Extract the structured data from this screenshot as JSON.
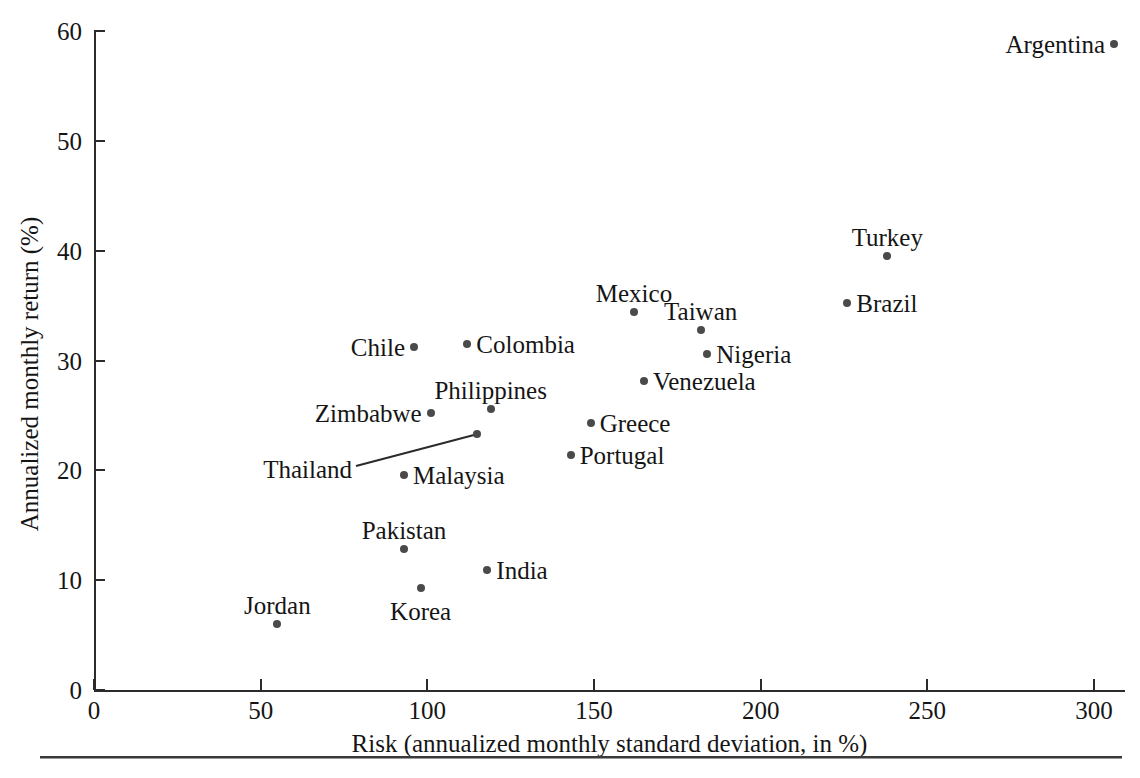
{
  "chart_data": {
    "type": "scatter",
    "title": "",
    "xlabel": "Risk (annualized monthly standard deviation, in %)",
    "ylabel": "Annualized monthly return (%)",
    "xlim": [
      0,
      310
    ],
    "ylim": [
      0,
      60
    ],
    "xticks": [
      0,
      50,
      100,
      150,
      200,
      250,
      300
    ],
    "yticks": [
      0,
      10,
      20,
      30,
      40,
      50,
      60
    ],
    "grid": false,
    "legend": "none",
    "point_color": "#4a4a4a",
    "axis_color": "#2b2b2b",
    "points": [
      {
        "name": "Argentina",
        "x": 306.0,
        "y": 58.8,
        "label_side": "left"
      },
      {
        "name": "Turkey",
        "x": 238.0,
        "y": 39.5,
        "label_side": "above"
      },
      {
        "name": "Brazil",
        "x": 226.0,
        "y": 35.2,
        "label_side": "right"
      },
      {
        "name": "Mexico",
        "x": 162.0,
        "y": 34.4,
        "label_side": "above"
      },
      {
        "name": "Taiwan",
        "x": 182.0,
        "y": 32.8,
        "label_side": "above"
      },
      {
        "name": "Colombia",
        "x": 112.0,
        "y": 31.5,
        "label_side": "right"
      },
      {
        "name": "Chile",
        "x": 96.0,
        "y": 31.2,
        "label_side": "left"
      },
      {
        "name": "Nigeria",
        "x": 184.0,
        "y": 30.6,
        "label_side": "right"
      },
      {
        "name": "Venezuela",
        "x": 165.0,
        "y": 28.1,
        "label_side": "right"
      },
      {
        "name": "Philippines",
        "x": 119.0,
        "y": 25.6,
        "label_side": "above"
      },
      {
        "name": "Zimbabwe",
        "x": 101.0,
        "y": 25.2,
        "label_side": "left"
      },
      {
        "name": "Greece",
        "x": 149.0,
        "y": 24.3,
        "label_side": "right"
      },
      {
        "name": "Thailand",
        "x": 115.0,
        "y": 23.3,
        "label_side": "leader"
      },
      {
        "name": "Portugal",
        "x": 143.0,
        "y": 21.4,
        "label_side": "right"
      },
      {
        "name": "Malaysia",
        "x": 93.0,
        "y": 19.6,
        "label_side": "right"
      },
      {
        "name": "Pakistan",
        "x": 93.0,
        "y": 12.8,
        "label_side": "above"
      },
      {
        "name": "India",
        "x": 118.0,
        "y": 10.9,
        "label_side": "right"
      },
      {
        "name": "Korea",
        "x": 98.0,
        "y": 9.3,
        "label_side": "below"
      },
      {
        "name": "Jordan",
        "x": 55.0,
        "y": 6.0,
        "label_side": "above"
      }
    ]
  }
}
